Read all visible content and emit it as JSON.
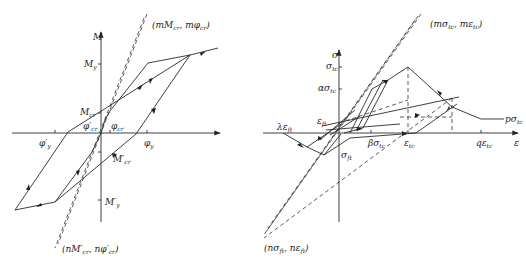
{
  "left_diagram": {
    "title": "Moment-curvature hysteresis model",
    "axis_labels": {
      "y": "M",
      "x": ""
    },
    "labels": {
      "top_point": "(mM",
      "top_point_sub1": "cr",
      "top_point_mid": ", mφ",
      "top_point_sub2": "cr",
      "top_point_end": ")",
      "bottom_point": "(nM′",
      "bottom_point_sub1": "cr",
      "bottom_point_mid": ", nφ′",
      "bottom_point_sub2": "cr",
      "bottom_point_end": ")",
      "My": "M",
      "My_sub": "y",
      "Mcr": "M",
      "Mcr_sub": "cr",
      "phi_cr_neg": "φ′",
      "phi_cr_neg_sub": "cr",
      "phi_cr": "φ",
      "phi_cr_sub": "cr",
      "phi_y_neg": "φ′",
      "phi_y_neg_sub": "y",
      "phi_y": "φ",
      "phi_y_sub": "y",
      "Mcr_neg": "M′",
      "Mcr_neg_sub": "cr",
      "My_neg": "M′",
      "My_neg_sub": "y"
    }
  },
  "right_diagram": {
    "title": "Stress-strain hysteresis model",
    "axis_labels": {
      "y": "σ",
      "x": "ε"
    },
    "labels": {
      "top_point": "(mσ",
      "top_point_sub1": "tc",
      "top_point_mid": ", mε",
      "top_point_sub2": "tc",
      "top_point_end": ")",
      "bottom_point": "(nσ",
      "bottom_point_sub1": "ft",
      "bottom_point_mid": ", nε",
      "bottom_point_sub2": "ft",
      "bottom_point_end": ")",
      "sigma_tc": "σ",
      "sigma_tc_sub": "tc",
      "alpha_sigma": "ασ",
      "alpha_sigma_sub": "tc",
      "eps_ft": "ε",
      "eps_ft_sub": "ft",
      "lambda_eps": "λε",
      "lambda_eps_sub": "ft",
      "sigma_ft": "σ",
      "sigma_ft_sub": "ft",
      "beta_sigma": "βσ",
      "beta_sigma_sub": "tc",
      "eps_tc": "ε",
      "eps_tc_sub": "tc",
      "q_eps": "qε",
      "q_eps_sub": "tc",
      "p_sigma": "pσ",
      "p_sigma_sub": "tc"
    }
  }
}
